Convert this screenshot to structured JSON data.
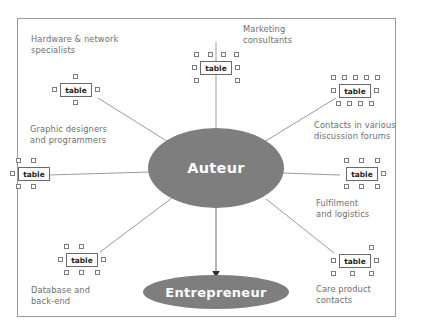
{
  "diagram": {
    "center_node": {
      "label": "Auteur",
      "shape": "ellipse",
      "color": "#7e7e7e",
      "text_color": "#ffffff"
    },
    "target_node": {
      "label": "Entrepreneur",
      "shape": "ellipse",
      "color": "#7e7e7e",
      "text_color": "#ffffff"
    },
    "node_label": "table",
    "frame_color": "#9a9a9a",
    "line_color": "#9b9b9b",
    "label_color": "#6f6f6f",
    "satellites": [
      {
        "id": "hardware",
        "caption": "Hardware & network\nspecialists",
        "node_label": "table"
      },
      {
        "id": "marketing",
        "caption": "Marketing\nconsultants",
        "node_label": "table"
      },
      {
        "id": "forums",
        "caption": "Contacts in various\ndiscussion forums",
        "node_label": "table"
      },
      {
        "id": "graphic",
        "caption": "Graphic designers\nand programmers",
        "node_label": "table"
      },
      {
        "id": "fulfilment",
        "caption": "Fulfilment\nand logistics",
        "node_label": "table"
      },
      {
        "id": "database",
        "caption": "Database and\nback-end",
        "node_label": "table"
      },
      {
        "id": "care",
        "caption": "Care product\ncontacts",
        "node_label": "table"
      }
    ]
  }
}
